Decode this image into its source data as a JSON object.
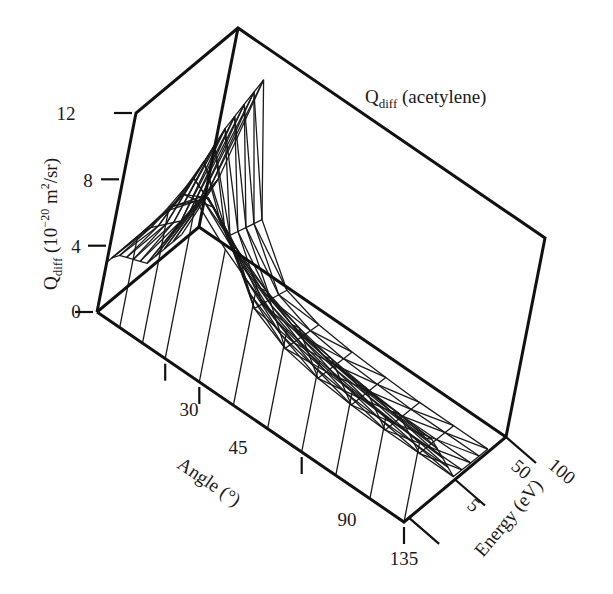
{
  "chart_data": {
    "type": "surface3d",
    "title_main": "Q",
    "title_sub": "diff",
    "title_rest": " (acetylene)",
    "zlabel": "Q_diff (10^-20 m^2/sr)",
    "zlabel_parts": {
      "q": "Q",
      "sub": "diff",
      "paren": " (10",
      "exp": "−20",
      "unit": " m",
      "unit_exp": "2",
      "tail": "/sr)"
    },
    "xlabel": "Angle (°)",
    "ylabel": "Energy (eV)",
    "z_ticks": [
      "0",
      "4",
      "8",
      "12"
    ],
    "z_tick_values": [
      0,
      4,
      8,
      12
    ],
    "zlim": [
      0,
      12
    ],
    "x_ticks": [
      "30",
      "45",
      "90",
      "135"
    ],
    "x_tick_values": [
      30,
      45,
      90,
      135
    ],
    "xlim": [
      0,
      135
    ],
    "y_ticks": [
      "5",
      "50",
      "100"
    ],
    "y_tick_values": [
      5,
      50,
      100
    ],
    "ylim": [
      0,
      100
    ],
    "grid": false,
    "legend": null,
    "series": [
      {
        "name": "Q_diff at 5 eV",
        "angles": [
          0,
          10,
          20,
          30,
          45,
          60,
          75,
          90,
          105,
          120,
          135
        ],
        "values": [
          3.0,
          5.5,
          8.0,
          9.5,
          8.0,
          6.8,
          6.0,
          5.5,
          5.2,
          5.0,
          4.8
        ]
      },
      {
        "name": "Q_diff at 50 eV",
        "angles": [
          0,
          10,
          20,
          30,
          45,
          60,
          75,
          90,
          105,
          120,
          135
        ],
        "values": [
          0.5,
          4.0,
          10.5,
          5.0,
          2.0,
          1.0,
          0.6,
          0.4,
          0.3,
          0.3,
          0.3
        ]
      },
      {
        "name": "Q_diff at 100 eV",
        "angles": [
          0,
          10,
          20,
          30,
          45,
          60,
          75,
          90,
          105,
          120,
          135
        ],
        "values": [
          0.5,
          5.0,
          12.0,
          4.0,
          1.2,
          0.6,
          0.4,
          0.3,
          0.2,
          0.2,
          0.2
        ]
      }
    ]
  }
}
